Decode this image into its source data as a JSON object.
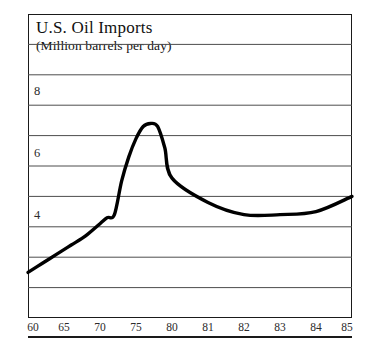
{
  "chart_data": {
    "type": "line",
    "title": "U.S. Oil Imports",
    "subtitle": "(Million barrels per day)",
    "xlabel": "",
    "ylabel": "",
    "ylim": [
      0,
      10
    ],
    "xlim": [
      1960,
      1985
    ],
    "grid": true,
    "legend": false,
    "yticks": [
      4,
      6,
      8
    ],
    "ytick_labels": [
      "4",
      "6",
      "8"
    ],
    "gridline_values": [
      1,
      2,
      3,
      4,
      5,
      6,
      7,
      8,
      9
    ],
    "xticks": [
      1960,
      1965,
      1970,
      1975,
      1980,
      1981,
      1982,
      1983,
      1984,
      1985
    ],
    "xtick_labels": [
      "60",
      "65",
      "70",
      "75",
      "80",
      "81",
      "82",
      "83",
      "84",
      "85"
    ],
    "series": [
      {
        "name": "U.S. Oil Imports",
        "color": "#000000",
        "x": [
          1960,
          1962,
          1964,
          1966,
          1968,
          1970,
          1971,
          1972,
          1973,
          1974,
          1975,
          1976,
          1977,
          1978,
          1979,
          1980,
          1981,
          1982,
          1983,
          1984,
          1985
        ],
        "values": [
          1.5,
          1.8,
          2.1,
          2.4,
          2.7,
          3.1,
          3.3,
          3.4,
          4.5,
          5.3,
          5.9,
          6.3,
          6.4,
          6.3,
          5.6,
          4.6,
          3.8,
          3.4,
          3.4,
          3.5,
          4.0
        ]
      }
    ]
  },
  "xaxis_ticks": [
    {
      "label": "60"
    },
    {
      "label": "65"
    },
    {
      "label": "70"
    },
    {
      "label": "75"
    },
    {
      "label": "80"
    },
    {
      "label": "81"
    },
    {
      "label": "82"
    },
    {
      "label": "83"
    },
    {
      "label": "84"
    },
    {
      "label": "85"
    }
  ],
  "yaxis_ticks": [
    {
      "label": "8"
    },
    {
      "label": "6"
    },
    {
      "label": "4"
    }
  ]
}
